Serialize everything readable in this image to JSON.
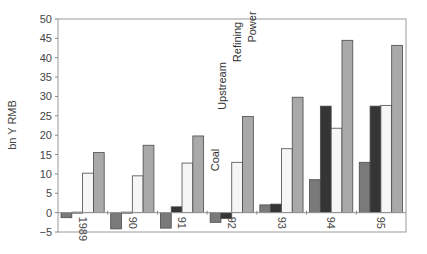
{
  "chart_data": {
    "type": "bar",
    "title": "",
    "xlabel": "",
    "ylabel": "bn Y RMB",
    "ylim": [
      -5,
      50
    ],
    "yticks": [
      -5,
      0,
      5,
      10,
      15,
      20,
      25,
      30,
      35,
      40,
      45,
      50
    ],
    "categories": [
      "1989",
      "90",
      "91",
      "92",
      "93",
      "94",
      "95"
    ],
    "series": [
      {
        "name": "Coal",
        "color": "#7a7a7a",
        "values": [
          -1.3,
          -4.2,
          -4.0,
          -2.5,
          2.0,
          8.5,
          13.0
        ]
      },
      {
        "name": "Upstream",
        "color": "#353535",
        "values": [
          0.0,
          0.0,
          1.5,
          -1.5,
          2.2,
          27.5,
          27.5
        ]
      },
      {
        "name": "Refining",
        "color": "#f6f6f6",
        "values": [
          10.2,
          9.5,
          12.8,
          13.0,
          16.5,
          21.8,
          27.7
        ]
      },
      {
        "name": "Power",
        "color": "#a9a9a9",
        "values": [
          15.5,
          17.4,
          19.8,
          24.8,
          29.8,
          44.5,
          43.2
        ]
      }
    ],
    "series_labels": [
      {
        "text": "Coal",
        "x": 219,
        "y": 160
      },
      {
        "text": "Upstream",
        "x": 226,
        "y": 86
      },
      {
        "text": "Refining",
        "x": 241,
        "y": 42
      },
      {
        "text": "Power",
        "x": 256,
        "y": 27
      }
    ],
    "grid": false,
    "legend": "inline rotated labels above 1992 bars"
  }
}
